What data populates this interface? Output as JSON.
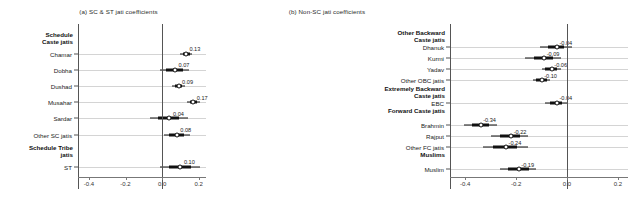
{
  "figure": {
    "axis_ticks": [
      "-0.4",
      "-0.2",
      "0.0",
      "0.2"
    ],
    "axis_tick_values": [
      -0.4,
      -0.2,
      0.0,
      0.2
    ],
    "xlim": [
      -0.46,
      0.24
    ]
  },
  "chart_data": [
    {
      "type": "scatter",
      "title": "(a) SC & ST jati coefficients",
      "xlabel": "",
      "ylabel": "",
      "xlim": [
        -0.46,
        0.24
      ],
      "xticks": [
        -0.4,
        -0.2,
        0.0,
        0.2
      ],
      "xticklabels": [
        "-0.4",
        "-0.2",
        "0.0",
        "0.2"
      ],
      "grid": true,
      "legend": "none",
      "reference_line": 0.0,
      "groups": [
        {
          "label": "Schedule\nCaste jatis",
          "label_line1": "Schedule",
          "label_line2": "Caste jatis",
          "rows": [
            {
              "label": "Chamar",
              "value": 0.13,
              "value_label": "0.13",
              "ci_inner": [
                0.115,
                0.15
              ],
              "ci_outer": [
                0.1,
                0.165
              ]
            },
            {
              "label": "Dobha",
              "value": 0.07,
              "value_label": "0.07",
              "ci_inner": [
                0.02,
                0.115
              ],
              "ci_outer": [
                -0.01,
                0.145
              ]
            },
            {
              "label": "Dushad",
              "value": 0.09,
              "value_label": "0.09",
              "ci_inner": [
                0.07,
                0.11
              ],
              "ci_outer": [
                0.055,
                0.125
              ]
            },
            {
              "label": "Musahar",
              "value": 0.17,
              "value_label": "0.17",
              "ci_inner": [
                0.15,
                0.19
              ],
              "ci_outer": [
                0.135,
                0.205
              ]
            },
            {
              "label": "Sardar",
              "value": 0.04,
              "value_label": "0.04",
              "ci_inner": [
                -0.02,
                0.095
              ],
              "ci_outer": [
                -0.065,
                0.14
              ]
            },
            {
              "label": "Other SC jatis",
              "value": 0.08,
              "value_label": "0.08",
              "ci_inner": [
                0.04,
                0.12
              ],
              "ci_outer": [
                0.01,
                0.15
              ]
            }
          ]
        },
        {
          "label": "Schedule Tribe\njatis",
          "label_line1": "Schedule Tribe",
          "label_line2": "jatis",
          "rows": [
            {
              "label": "ST",
              "value": 0.1,
              "value_label": "0.10",
              "ci_inner": [
                0.035,
                0.16
              ],
              "ci_outer": [
                -0.01,
                0.205
              ]
            }
          ]
        }
      ]
    },
    {
      "type": "scatter",
      "title": "(b) Non-SC jati coefficients",
      "xlabel": "",
      "ylabel": "",
      "xlim": [
        -0.46,
        0.24
      ],
      "xticks": [
        -0.4,
        -0.2,
        0.0,
        0.2
      ],
      "xticklabels": [
        "-0.4",
        "-0.2",
        "0.0",
        "0.2"
      ],
      "grid": true,
      "legend": "none",
      "reference_line": 0.0,
      "groups": [
        {
          "label": "Other Backward\nCaste jatis",
          "label_line1": "Other Backward",
          "label_line2": "Caste jatis",
          "rows": [
            {
              "label": "Dhanuk",
              "value": -0.04,
              "value_label": "-0.04",
              "ci_inner": [
                -0.075,
                -0.01
              ],
              "ci_outer": [
                -0.105,
                0.02
              ]
            },
            {
              "label": "Kurmi",
              "value": -0.09,
              "value_label": "-0.09",
              "ci_inner": [
                -0.13,
                -0.055
              ],
              "ci_outer": [
                -0.165,
                -0.025
              ]
            },
            {
              "label": "Yadav",
              "value": -0.06,
              "value_label": "-0.06",
              "ci_inner": [
                -0.085,
                -0.04
              ],
              "ci_outer": [
                -0.1,
                -0.025
              ]
            },
            {
              "label": "Other OBC jatis",
              "value": -0.1,
              "value_label": "-0.10",
              "ci_inner": [
                -0.12,
                -0.08
              ],
              "ci_outer": [
                -0.135,
                -0.065
              ]
            }
          ]
        },
        {
          "label": "Extremely Backward\nCaste jatis",
          "label_line1": "Extremely Backward",
          "label_line2": "Caste jatis",
          "rows": [
            {
              "label": "EBC",
              "value": -0.04,
              "value_label": "-0.04",
              "ci_inner": [
                -0.065,
                -0.02
              ],
              "ci_outer": [
                -0.085,
                0.0
              ]
            }
          ]
        },
        {
          "label": "Forward Caste jatis",
          "label_line1": "Forward Caste jatis",
          "label_line2": "",
          "rows": [
            {
              "label": "Brahmin",
              "value": -0.34,
              "value_label": "-0.34",
              "ci_inner": [
                -0.375,
                -0.305
              ],
              "ci_outer": [
                -0.405,
                -0.275
              ]
            },
            {
              "label": "Rajput",
              "value": -0.22,
              "value_label": "-0.22",
              "ci_inner": [
                -0.265,
                -0.185
              ],
              "ci_outer": [
                -0.3,
                -0.155
              ]
            },
            {
              "label": "Other FC jatis",
              "value": -0.24,
              "value_label": "-0.24",
              "ci_inner": [
                -0.29,
                -0.195
              ],
              "ci_outer": [
                -0.33,
                -0.155
              ]
            }
          ]
        },
        {
          "label": "Muslims",
          "label_line1": "Muslims",
          "label_line2": "",
          "rows": [
            {
              "label": "Muslim",
              "value": -0.19,
              "value_label": "-0.19",
              "ci_inner": [
                -0.23,
                -0.15
              ],
              "ci_outer": [
                -0.265,
                -0.12
              ]
            }
          ]
        }
      ]
    }
  ]
}
